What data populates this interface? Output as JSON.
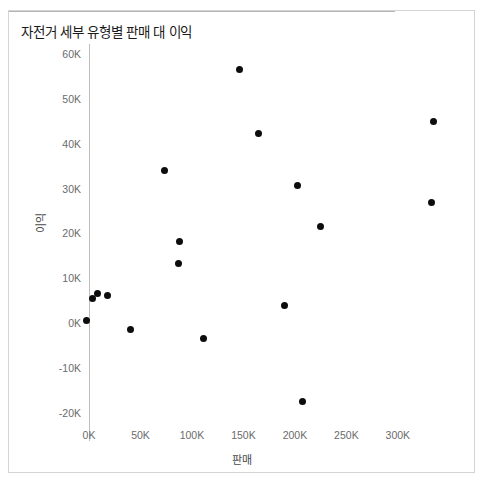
{
  "chart_data": {
    "type": "scatter",
    "title": "자전거 세부 유형별 판매 대 이익",
    "xlabel": "판매",
    "ylabel": "이익",
    "xlim": [
      -10000,
      360000
    ],
    "ylim": [
      -24000,
      62000
    ],
    "grid": false,
    "legend": null,
    "marker_color": "#0d0d0d",
    "zero_reference_line": 0,
    "xticks": [
      "0K",
      "50K",
      "100K",
      "150K",
      "200K",
      "250K",
      "300K"
    ],
    "xtick_values": [
      0,
      50000,
      100000,
      150000,
      200000,
      250000,
      300000
    ],
    "yticks": [
      "60K",
      "50K",
      "40K",
      "30K",
      "20K",
      "10K",
      "0K",
      "-10K",
      "-20K"
    ],
    "ytick_values": [
      60000,
      50000,
      40000,
      30000,
      20000,
      10000,
      0,
      -10000,
      -20000
    ],
    "points": [
      {
        "x": 3000,
        "y": 5500
      },
      {
        "x": 8000,
        "y": 6500
      },
      {
        "x": 18000,
        "y": 6200
      },
      {
        "x": -2000,
        "y": 600
      },
      {
        "x": 40000,
        "y": -1400
      },
      {
        "x": 73000,
        "y": 34000
      },
      {
        "x": 87000,
        "y": 13200
      },
      {
        "x": 88000,
        "y": 18200
      },
      {
        "x": 111000,
        "y": -3400
      },
      {
        "x": 146000,
        "y": 56500
      },
      {
        "x": 165000,
        "y": 42200
      },
      {
        "x": 190000,
        "y": 3900
      },
      {
        "x": 203000,
        "y": 30700
      },
      {
        "x": 207000,
        "y": -17500
      },
      {
        "x": 225000,
        "y": 21600
      },
      {
        "x": 333000,
        "y": 27000
      },
      {
        "x": 335000,
        "y": 45000
      }
    ]
  }
}
